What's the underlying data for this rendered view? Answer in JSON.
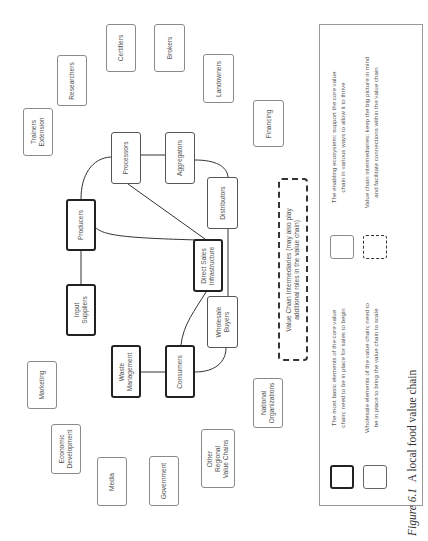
{
  "figure": {
    "orientation": "rotated 90 degrees counter-clockwise",
    "caption_label": "Figure 6.1",
    "caption_text": "A local food value chain"
  },
  "core_elements": {
    "producers": "Producers",
    "input_suppliers": "Input Suppliers",
    "consumers": "Consumers",
    "waste_management": "Waste Management",
    "direct_sales_line1": "Direct Sales",
    "direct_sales_line2": "Infrastructure",
    "input_suppliers_line1": "Input",
    "input_suppliers_line2": "Suppliers",
    "waste_line1": "Waste",
    "waste_line2": "Management"
  },
  "wholesale_elements": {
    "processors": "Processors",
    "aggregators": "Aggregators",
    "distributors": "Distributors",
    "wholesale_line1": "Wholesale",
    "wholesale_line2": "Buyers"
  },
  "ecosystem": {
    "trainers_line1": "Trainers",
    "trainers_line2": "Extension",
    "researchers": "Researchers",
    "certifiers": "Certifiers",
    "brokers": "Brokers",
    "landowners": "Landowners",
    "financing": "Financing",
    "marketing": "Marketing",
    "econ_line1": "Economic",
    "econ_line2": "Development",
    "media": "Media",
    "government": "Government",
    "other_line1": "Other",
    "other_line2": "Regional",
    "other_line3": "Value Chains",
    "national_line1": "National",
    "national_line2": "Organizations"
  },
  "intermediaries": {
    "line1": "Value Chain Intermediaries (may also play",
    "line2": "additional roles in the value chain)"
  },
  "legend": {
    "core_line1": "The most basic elements of the core value",
    "core_line2": "chain; need to be in place for sales to begin",
    "wholesale_line1": "Wholesale elements of the value chain; need to",
    "wholesale_line2": "be in place to bring the value chain to scale",
    "eco_line1": "The enabling ecosystem: support the core value",
    "eco_line2": "chain in various ways to allow it to thrive",
    "inter_line1": "Value chain intermediaries: keep the big picture in mind",
    "inter_line2": "and facilitate connections within the value chain"
  },
  "connections": [
    [
      "Producers",
      "Input Suppliers"
    ],
    [
      "Producers",
      "Processors"
    ],
    [
      "Producers",
      "Direct Sales Infrastructure"
    ],
    [
      "Processors",
      "Aggregators"
    ],
    [
      "Processors",
      "Direct Sales Infrastructure"
    ],
    [
      "Aggregators",
      "Distributors"
    ],
    [
      "Distributors",
      "Wholesale Buyers"
    ],
    [
      "Direct Sales Infrastructure",
      "Consumers"
    ],
    [
      "Wholesale Buyers",
      "Consumers"
    ],
    [
      "Consumers",
      "Waste Management"
    ]
  ]
}
